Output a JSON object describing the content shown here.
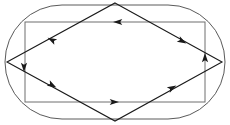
{
  "figure": {
    "width": 230,
    "height": 125,
    "background_color": "#ffffff"
  },
  "colors": {
    "stadium_stroke": "#5a5a5a",
    "rectangle_stroke": "#6e6e6e",
    "rhombus_stroke": "#1a1a1a",
    "arrow_fill": "#1a1a1a"
  },
  "strokes": {
    "stadium_width": 1,
    "rectangle_width": 1,
    "rhombus_width": 1.1
  },
  "shapes": {
    "stadium": {
      "name": "stadium-outline",
      "x": 5,
      "y": 5,
      "width": 220,
      "height": 114,
      "corner_radius": 57
    },
    "rectangle": {
      "name": "inner-rectangle",
      "x": 25,
      "y": 22,
      "width": 180,
      "height": 80
    },
    "rhombus": {
      "name": "rhombus",
      "points": "115,3 222,62 115,121 7,62",
      "vertices": {
        "top": [
          115,
          3
        ],
        "right": [
          222,
          62
        ],
        "bottom": [
          115,
          121
        ],
        "left": [
          7,
          62
        ]
      }
    }
  },
  "arrows": [
    {
      "id": "rect-top-arrow",
      "name": "arrow-rect-top-left",
      "x": 118,
      "y": 22,
      "rotation": 180,
      "size": 5,
      "direction": "left",
      "on_edge": "rectangle-top"
    },
    {
      "id": "rect-bottom-arrow",
      "name": "arrow-rect-bottom-right",
      "x": 114,
      "y": 102,
      "rotation": 0,
      "size": 5,
      "direction": "right",
      "on_edge": "rectangle-bottom"
    },
    {
      "id": "rhombus-top-left-arrow",
      "name": "arrow-rhombus-upper-left",
      "x": 52,
      "y": 40,
      "rotation": 208,
      "size": 5,
      "direction": "down-left",
      "on_edge": "rhombus-top-to-left"
    },
    {
      "id": "rhombus-top-right-arrow",
      "name": "arrow-rhombus-upper-right",
      "x": 182,
      "y": 41,
      "rotation": 29,
      "size": 5,
      "direction": "down-right",
      "on_edge": "rhombus-top-to-right"
    },
    {
      "id": "rhombus-bottom-left-arrow",
      "name": "arrow-rhombus-lower-left",
      "x": 52,
      "y": 85,
      "rotation": 29,
      "size": 5,
      "direction": "down-right",
      "on_edge": "rhombus-left-to-bottom"
    },
    {
      "id": "rhombus-bottom-right-arrow",
      "name": "arrow-rhombus-lower-right",
      "x": 172,
      "y": 88,
      "rotation": 331,
      "size": 5,
      "direction": "up-right",
      "on_edge": "rhombus-bottom-to-right"
    },
    {
      "id": "left-vertex-arrow",
      "name": "arrow-left-vertex-down",
      "x": 24,
      "y": 67,
      "rotation": 90,
      "size": 5,
      "direction": "down",
      "on_edge": "rectangle-left"
    },
    {
      "id": "right-vertex-arrow",
      "name": "arrow-right-vertex-up",
      "x": 205,
      "y": 58,
      "rotation": 270,
      "size": 5,
      "direction": "up",
      "on_edge": "rectangle-right"
    }
  ]
}
